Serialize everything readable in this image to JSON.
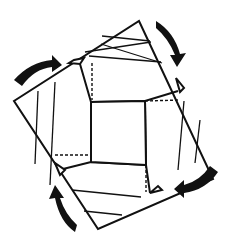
{
  "diagram": {
    "title": "",
    "colors": {
      "line": "#111111",
      "background": "#ffffff"
    },
    "elements": {
      "outer_square": "rotated square outline",
      "center_square": "central square",
      "flaps": [
        "top-flap",
        "right-flap",
        "bottom-flap",
        "left-flap"
      ],
      "arrows": [
        "top-left-arrow",
        "top-right-arrow",
        "bottom-right-arrow",
        "bottom-left-arrow"
      ]
    }
  }
}
